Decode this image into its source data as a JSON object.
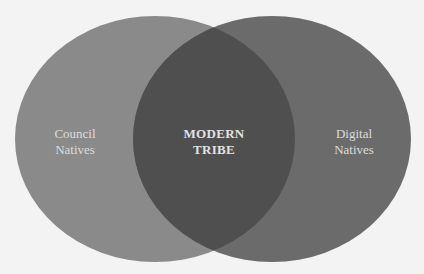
{
  "diagram": {
    "type": "venn",
    "background_color": "#f3f3f3",
    "sets": [
      {
        "id": "left",
        "label_lines": [
          "Council",
          "Natives"
        ],
        "color": "#8a8a8a",
        "cx": 155,
        "cy": 139,
        "rx": 140,
        "ry": 123
      },
      {
        "id": "right",
        "label_lines": [
          "Digital",
          "Natives"
        ],
        "color": "#6b6b6b",
        "cx": 272,
        "cy": 139,
        "rx": 139,
        "ry": 123
      }
    ],
    "intersection": {
      "label_lines": [
        "MODERN",
        "TRIBE"
      ],
      "color": "#4f4f4f"
    },
    "text_color": "#dcdcdc"
  }
}
